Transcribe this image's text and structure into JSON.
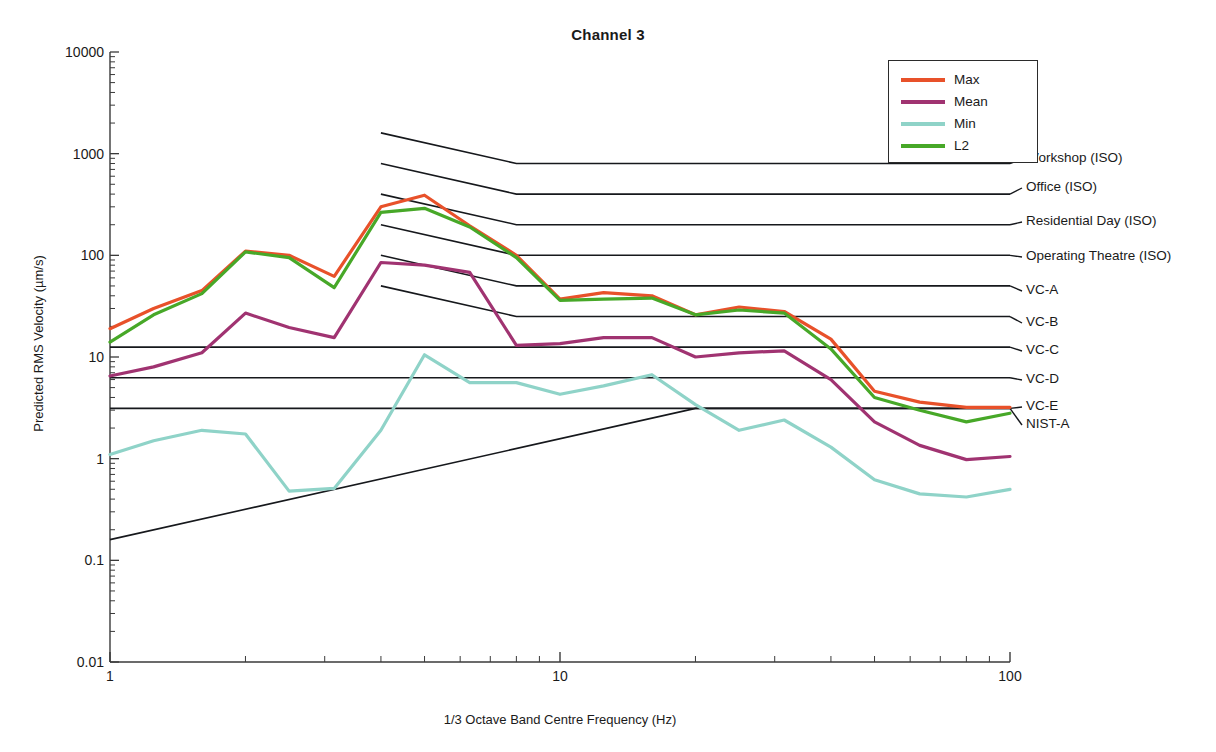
{
  "chart_data": {
    "type": "line",
    "title": "Channel 3",
    "xlabel": "1/3 Octave Band Centre Frequency (Hz)",
    "ylabel": "Predicted RMS Velocity (µm/s)",
    "xscale": "log",
    "yscale": "log",
    "xlim": [
      1,
      100
    ],
    "ylim": [
      0.01,
      10000
    ],
    "xticks": [
      1,
      10,
      100
    ],
    "xtick_labels": [
      "1",
      "10",
      "100"
    ],
    "yticks": [
      0.01,
      0.1,
      1,
      10,
      100,
      1000,
      10000
    ],
    "ytick_labels": [
      "0.01",
      "0.1",
      "1",
      "10",
      "100",
      "1000",
      "10000"
    ],
    "grid": false,
    "legend_position": "top-right",
    "x": [
      1,
      1.25,
      1.6,
      2,
      2.5,
      3.15,
      4,
      5,
      6.3,
      8,
      10,
      12.5,
      16,
      20,
      25,
      31.5,
      40,
      50,
      63,
      80,
      100
    ],
    "series": [
      {
        "name": "Max",
        "color": "#e8512a",
        "values": [
          19,
          30,
          45,
          110,
          100,
          62,
          300,
          390,
          195,
          100,
          37,
          43,
          40,
          26,
          31,
          28,
          15,
          4.6,
          3.6,
          3.2,
          3.2
        ]
      },
      {
        "name": "Mean",
        "color": "#a03371",
        "values": [
          6.5,
          8.0,
          11.0,
          27,
          19.5,
          15.5,
          85,
          80,
          68,
          13,
          13.5,
          15.5,
          15.5,
          10,
          11,
          11.5,
          6.0,
          2.3,
          1.35,
          0.98,
          1.05
        ]
      },
      {
        "name": "Min",
        "color": "#8fd3c8",
        "values": [
          1.1,
          1.5,
          1.9,
          1.75,
          0.48,
          0.51,
          1.9,
          10.5,
          5.6,
          5.6,
          4.3,
          5.2,
          6.7,
          3.4,
          1.9,
          2.4,
          1.3,
          0.62,
          0.45,
          0.42,
          0.5
        ]
      },
      {
        "name": "L2",
        "color": "#47a828",
        "values": [
          14,
          26,
          42,
          108,
          95,
          48,
          265,
          290,
          190,
          95,
          36,
          37,
          38,
          26,
          29,
          27,
          12,
          4.0,
          3.0,
          2.3,
          2.8
        ]
      }
    ],
    "criteria": [
      {
        "name": "Workshop (ISO)",
        "start_value": 1600,
        "break_value": 800,
        "flat_value": 800
      },
      {
        "name": "Office (ISO)",
        "start_value": 800,
        "break_value": 400,
        "flat_value": 400
      },
      {
        "name": "Residential Day (ISO)",
        "start_value": 400,
        "break_value": 200,
        "flat_value": 200
      },
      {
        "name": "Operating Theatre (ISO)",
        "start_value": 200,
        "break_value": 100,
        "flat_value": 100
      },
      {
        "name": "VC-A",
        "start_value": 100,
        "break_value": 50,
        "flat_value": 50
      },
      {
        "name": "VC-B",
        "start_value": 50,
        "break_value": 25,
        "flat_value": 25
      },
      {
        "name": "VC-C",
        "start_value": 12.5,
        "break_value": 12.5,
        "flat_value": 12.5
      },
      {
        "name": "VC-D",
        "start_value": 6.25,
        "break_value": 6.25,
        "flat_value": 6.25
      },
      {
        "name": "VC-E",
        "start_value": 3.12,
        "break_value": 3.12,
        "flat_value": 3.12
      },
      {
        "name": "NIST-A",
        "start_value": 0.16,
        "break_value": 3.12,
        "flat_value": 3.12
      }
    ],
    "criteria_break_start_hz": 4,
    "criteria_break_end_hz": 8,
    "criteria_label_y": [
      159,
      188,
      222,
      257,
      291,
      323,
      351,
      380,
      407,
      425
    ]
  },
  "legend": {
    "entries": [
      {
        "label": "Max",
        "color": "#e8512a"
      },
      {
        "label": "Mean",
        "color": "#a03371"
      },
      {
        "label": "Min",
        "color": "#8fd3c8"
      },
      {
        "label": "L2",
        "color": "#47a828"
      }
    ]
  },
  "colors": {
    "axis": "#3a3a3a",
    "criteria_line": "#16181c",
    "text": "#1a1a1a",
    "background": "#ffffff"
  }
}
